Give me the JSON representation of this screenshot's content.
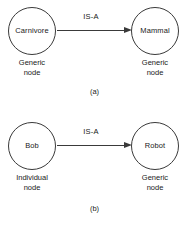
{
  "figures": [
    {
      "id": "a",
      "caption": "(a)",
      "source_node": {
        "label": "Carnivore",
        "caption_line1": "Generic",
        "caption_line2": "node"
      },
      "target_node": {
        "label": "Mammal",
        "caption_line1": "Generic",
        "caption_line2": "node"
      },
      "edge": {
        "label": "IS-A",
        "direction": "source-to-target"
      }
    },
    {
      "id": "b",
      "caption": "(b)",
      "source_node": {
        "label": "Bob",
        "caption_line1": "Individual",
        "caption_line2": "node"
      },
      "target_node": {
        "label": "Robot",
        "caption_line1": "Generic",
        "caption_line2": "node"
      },
      "edge": {
        "label": "IS-A",
        "direction": "source-to-target"
      }
    }
  ],
  "style": {
    "background_color": "#ffffff",
    "stroke_color": "#3a3a3a",
    "text_color": "#1a1a1a"
  }
}
